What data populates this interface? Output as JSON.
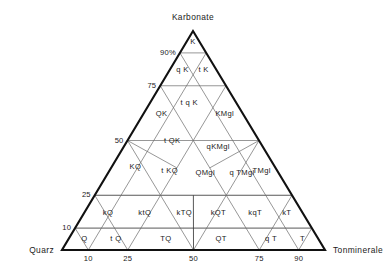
{
  "figure": {
    "type": "ternary-classification-diagram",
    "apex_label": "Karbonate",
    "left_corner_label": "Quarz",
    "right_corner_label": "Tonminerale"
  },
  "axes": {
    "left_axis_ticks": [
      {
        "value": 10,
        "label": "10"
      },
      {
        "value": 25,
        "label": "25"
      },
      {
        "value": 50,
        "label": "50"
      },
      {
        "value": 75,
        "label": "75"
      },
      {
        "value": 90,
        "label": "90%"
      }
    ],
    "bottom_axis_ticks": [
      {
        "value": 10,
        "label": "10"
      },
      {
        "value": 25,
        "label": "25"
      },
      {
        "value": 50,
        "label": "50"
      },
      {
        "value": 75,
        "label": "75"
      },
      {
        "value": 90,
        "label": "90"
      }
    ]
  },
  "chart_data": {
    "type": "ternary",
    "title": "",
    "vertices": {
      "top": "Karbonate",
      "bottom_left": "Quarz",
      "bottom_right": "Tonminerale"
    },
    "axis_ranges": {
      "carbonate": [
        0,
        100
      ],
      "quartz": [
        0,
        100
      ],
      "clay": [
        0,
        100
      ]
    },
    "grid": true,
    "gridlines_carbonate": [
      10,
      25,
      50,
      75,
      90
    ],
    "gridlines_quartz": [
      10,
      25,
      50,
      75,
      90
    ],
    "gridlines_clay": [
      10,
      25,
      50,
      75,
      90
    ],
    "legend_position": "none",
    "fields": [
      {
        "label": "K",
        "k": 95,
        "q": 2.5,
        "t": 2.5
      },
      {
        "label": "q K",
        "k": 82,
        "q": 13,
        "t": 5
      },
      {
        "label": "t K",
        "k": 82,
        "q": 5,
        "t": 13
      },
      {
        "label": "t q K",
        "k": 67,
        "q": 18,
        "t": 15
      },
      {
        "label": "KMgl",
        "k": 62,
        "q": 7,
        "t": 31
      },
      {
        "label": "QK",
        "k": 62,
        "q": 31,
        "t": 7
      },
      {
        "label": "t QK",
        "k": 50,
        "q": 33,
        "t": 17
      },
      {
        "label": "qKMgl",
        "k": 47,
        "q": 17,
        "t": 36
      },
      {
        "label": "KQ",
        "k": 38,
        "q": 53,
        "t": 9
      },
      {
        "label": "t KQ",
        "k": 36,
        "q": 41,
        "t": 23
      },
      {
        "label": "QMgl",
        "k": 35,
        "q": 28,
        "t": 37
      },
      {
        "label": "q TMgl",
        "k": 35,
        "q": 14,
        "t": 51
      },
      {
        "label": "TMgl",
        "k": 36,
        "q": 6,
        "t": 58
      },
      {
        "label": "kQ",
        "k": 17,
        "q": 74,
        "t": 9
      },
      {
        "label": "ktQ",
        "k": 17,
        "q": 60,
        "t": 23
      },
      {
        "label": "kTQ",
        "k": 17,
        "q": 45,
        "t": 38
      },
      {
        "label": "kQT",
        "k": 17,
        "q": 32,
        "t": 51
      },
      {
        "label": "kqT",
        "k": 17,
        "q": 18,
        "t": 65
      },
      {
        "label": "kT",
        "k": 17,
        "q": 6,
        "t": 77
      },
      {
        "label": "Q",
        "k": 5,
        "q": 89,
        "t": 6
      },
      {
        "label": "t Q",
        "k": 5,
        "q": 77,
        "t": 18
      },
      {
        "label": "TQ",
        "k": 5,
        "q": 58,
        "t": 37
      },
      {
        "label": "QT",
        "k": 5,
        "q": 37,
        "t": 58
      },
      {
        "label": "q T",
        "k": 5,
        "q": 18,
        "t": 77
      },
      {
        "label": "T",
        "k": 5,
        "q": 6,
        "t": 89
      }
    ]
  },
  "colors": {
    "outline": "#111111",
    "gridline": "#6a6a6a",
    "text": "#1a1a1a",
    "background": "#ffffff"
  }
}
